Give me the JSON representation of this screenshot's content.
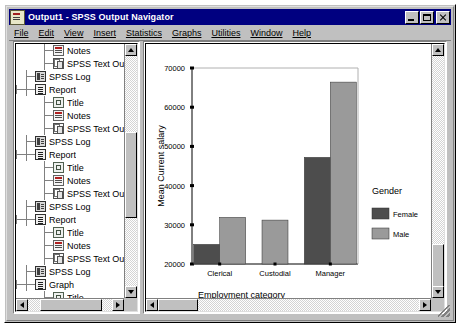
{
  "window": {
    "title": "Output1 - SPSS Output Navigator",
    "icon": "spss-output-icon",
    "buttons": {
      "minimize": "minimize-button",
      "maximize": "maximize-button",
      "close": "close-button"
    }
  },
  "menubar": {
    "items": [
      {
        "label": "File",
        "accel": "F"
      },
      {
        "label": "Edit",
        "accel": "E"
      },
      {
        "label": "View",
        "accel": "V"
      },
      {
        "label": "Insert",
        "accel": "I"
      },
      {
        "label": "Statistics",
        "accel": "S"
      },
      {
        "label": "Graphs",
        "accel": "G"
      },
      {
        "label": "Utilities",
        "accel": "U"
      },
      {
        "label": "Window",
        "accel": "W"
      },
      {
        "label": "Help",
        "accel": "H"
      }
    ]
  },
  "tree": {
    "rows": [
      {
        "label": "Notes",
        "icon": "notes-icon",
        "indent": 2,
        "toggle": ""
      },
      {
        "label": "SPSS Text Outp..",
        "icon": "text-output-icon",
        "indent": 2,
        "toggle": ""
      },
      {
        "label": "SPSS Log",
        "icon": "spss-log-icon",
        "indent": 1,
        "toggle": ""
      },
      {
        "label": "Report",
        "icon": "report-icon",
        "indent": 1,
        "toggle": "-"
      },
      {
        "label": "Title",
        "icon": "title-icon",
        "indent": 2,
        "toggle": ""
      },
      {
        "label": "Notes",
        "icon": "notes-icon",
        "indent": 2,
        "toggle": ""
      },
      {
        "label": "SPSS Text Outp..",
        "icon": "text-output-icon",
        "indent": 2,
        "toggle": ""
      },
      {
        "label": "SPSS Log",
        "icon": "spss-log-icon",
        "indent": 1,
        "toggle": ""
      },
      {
        "label": "Report",
        "icon": "report-icon",
        "indent": 1,
        "toggle": "-"
      },
      {
        "label": "Title",
        "icon": "title-icon",
        "indent": 2,
        "toggle": ""
      },
      {
        "label": "Notes",
        "icon": "notes-icon",
        "indent": 2,
        "toggle": ""
      },
      {
        "label": "SPSS Text Outp..",
        "icon": "text-output-icon",
        "indent": 2,
        "toggle": ""
      },
      {
        "label": "SPSS Log",
        "icon": "spss-log-icon",
        "indent": 1,
        "toggle": ""
      },
      {
        "label": "Report",
        "icon": "report-icon",
        "indent": 1,
        "toggle": "-"
      },
      {
        "label": "Title",
        "icon": "title-icon",
        "indent": 2,
        "toggle": ""
      },
      {
        "label": "Notes",
        "icon": "notes-icon",
        "indent": 2,
        "toggle": ""
      },
      {
        "label": "SPSS Text Outp..",
        "icon": "text-output-icon",
        "indent": 2,
        "toggle": ""
      },
      {
        "label": "SPSS Log",
        "icon": "spss-log-icon",
        "indent": 1,
        "toggle": ""
      },
      {
        "label": "Graph",
        "icon": "report-icon",
        "indent": 1,
        "toggle": "-"
      },
      {
        "label": "Title",
        "icon": "title-icon",
        "indent": 2,
        "toggle": ""
      },
      {
        "label": "Notes",
        "icon": "notes-icon",
        "indent": 2,
        "toggle": ""
      },
      {
        "label": "Bar of count by s",
        "icon": "bar-chart-icon",
        "indent": 2,
        "toggle": ""
      },
      {
        "label": "SPSS Log",
        "icon": "spss-log-icon",
        "indent": 1,
        "toggle": ""
      },
      {
        "label": "Graph",
        "icon": "report-icon",
        "indent": 1,
        "toggle": "-"
      },
      {
        "label": "Title",
        "icon": "title-icon",
        "indent": 2,
        "toggle": ""
      },
      {
        "label": "Notes",
        "icon": "notes-icon",
        "indent": 2,
        "toggle": ""
      }
    ],
    "scroll": {
      "up_arrow": "scroll-up-arrow",
      "down_arrow": "scroll-down-arrow",
      "left_arrow": "scroll-left-arrow",
      "right_arrow": "scroll-right-arrow"
    }
  },
  "chart_data": {
    "type": "bar",
    "title": "",
    "xlabel": "Employment category",
    "ylabel": "Mean Current salary",
    "categories": [
      "Clerical",
      "Custodial",
      "Manager"
    ],
    "series": [
      {
        "name": "Female",
        "color": "#4d4d4d",
        "values": [
          25000,
          null,
          47200
        ]
      },
      {
        "name": "Male",
        "color": "#9a9a9a",
        "values": [
          31900,
          31200,
          66400
        ]
      }
    ],
    "ylim": [
      20000,
      70000
    ],
    "yticks": [
      20000,
      30000,
      40000,
      50000,
      60000,
      70000
    ],
    "ytick_labels": [
      "20000",
      "30000",
      "40000",
      "50000",
      "60000",
      "70000"
    ],
    "grid": false,
    "legend": {
      "title": "Gender",
      "position": "right",
      "entries": [
        {
          "label": "Female",
          "color": "#4d4d4d"
        },
        {
          "label": "Male",
          "color": "#9a9a9a"
        }
      ]
    }
  }
}
